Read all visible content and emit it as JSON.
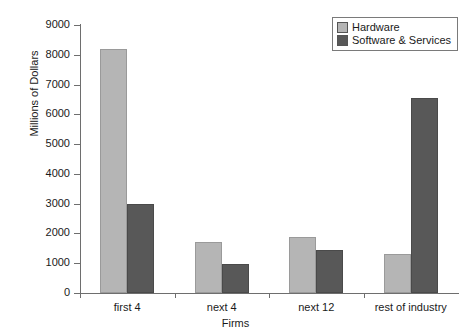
{
  "chart_data": {
    "type": "bar",
    "title": "",
    "xlabel": "Firms",
    "ylabel": "Millions of Dollars",
    "categories": [
      "first 4",
      "next 4",
      "next 12",
      "rest of industry"
    ],
    "series": [
      {
        "name": "Hardware",
        "color": "#b5b5b5",
        "values": [
          8200,
          1700,
          1880,
          1300
        ]
      },
      {
        "name": "Software & Services",
        "color": "#585858",
        "values": [
          3000,
          960,
          1450,
          6550
        ]
      }
    ],
    "ylim": [
      0,
      9000
    ],
    "yticks": [
      0,
      1000,
      2000,
      3000,
      4000,
      5000,
      6000,
      7000,
      8000,
      9000
    ],
    "ytick_labels": [
      "0",
      "1000",
      "2000",
      "3000",
      "4000",
      "5000",
      "6000",
      "7000",
      "8000",
      "9000"
    ],
    "grid": false,
    "legend_position": "top-right",
    "legend_entries": [
      "Hardware",
      "Software & Services"
    ]
  },
  "legend": {
    "items": [
      {
        "label": "Hardware",
        "swatch": "legend-swatch-hardware"
      },
      {
        "label": "Software & Services",
        "swatch": "legend-swatch-software"
      }
    ]
  },
  "axes": {
    "y_title": "Millions of Dollars",
    "x_title": "Firms"
  }
}
